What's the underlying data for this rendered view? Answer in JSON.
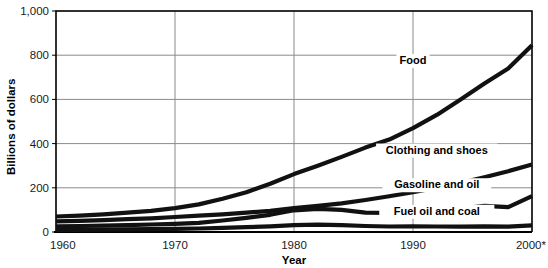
{
  "chart_data": {
    "type": "line",
    "title": "",
    "xlabel": "Year",
    "ylabel": "Billions of dollars",
    "xlim": [
      1960,
      2000
    ],
    "ylim": [
      0,
      1000
    ],
    "grid": true,
    "legend_position": "inline-labels",
    "x_ticks": [
      1960,
      1970,
      1980,
      1990,
      2000
    ],
    "x_tick_labels": [
      "1960",
      "1970",
      "1980",
      "1990",
      "2000*"
    ],
    "y_ticks": [
      0,
      200,
      400,
      600,
      800,
      1000
    ],
    "y_tick_labels": [
      "0",
      "200",
      "400",
      "600",
      "800",
      "1,000"
    ],
    "x": [
      1960,
      1962,
      1964,
      1966,
      1968,
      1970,
      1972,
      1974,
      1976,
      1978,
      1980,
      1982,
      1984,
      1986,
      1988,
      1990,
      1992,
      1994,
      1996,
      1998,
      2000
    ],
    "series": [
      {
        "name": "Food",
        "label": "Food",
        "label_x": 1990,
        "label_y": 760,
        "values": [
          70,
          74,
          80,
          88,
          96,
          108,
          122,
          146,
          172,
          205,
          245,
          285,
          320,
          355,
          395,
          405,
          455,
          510,
          560,
          610,
          648
        ]
      },
      {
        "name": "Clothing and shoes",
        "label": "Clothing and shoes",
        "label_x": 1992,
        "label_y": 355,
        "values": [
          25,
          27,
          30,
          34,
          38,
          43,
          49,
          55,
          62,
          72,
          82,
          90,
          100,
          112,
          124,
          136,
          150,
          168,
          188,
          212,
          240
        ]
      },
      {
        "name": "Gasoline and oil",
        "label": "Gasoline and oil",
        "label_x": 1992,
        "label_y": 198,
        "values": [
          14,
          15,
          16,
          18,
          20,
          23,
          26,
          34,
          42,
          50,
          78,
          88,
          85,
          70,
          68,
          78,
          80,
          85,
          95,
          92,
          130
        ]
      },
      {
        "name": "Fuel oil and coal",
        "label": "Fuel oil and coal",
        "label_x": 1992,
        "label_y": 78,
        "values": [
          5,
          5,
          6,
          6,
          7,
          8,
          9,
          12,
          14,
          17,
          22,
          24,
          23,
          19,
          17,
          18,
          17,
          16,
          18,
          16,
          20
        ]
      }
    ],
    "series_render": {
      "Food": {
        "values": [
          70,
          74,
          80,
          88,
          96,
          108,
          125,
          150,
          180,
          218,
          262,
          300,
          340,
          382,
          418,
          470,
          530,
          600,
          672,
          740,
          845
        ]
      },
      "Clothing and shoes": {
        "values": [
          48,
          50,
          54,
          58,
          62,
          68,
          74,
          80,
          88,
          96,
          108,
          118,
          130,
          145,
          162,
          180,
          200,
          222,
          248,
          275,
          305
        ]
      },
      "Gasoline and oil": {
        "values": [
          26,
          27,
          29,
          31,
          34,
          37,
          41,
          52,
          64,
          78,
          98,
          105,
          100,
          88,
          86,
          96,
          100,
          106,
          118,
          112,
          162
        ]
      },
      "Fuel oil and coal": {
        "values": [
          10,
          10,
          11,
          12,
          13,
          14,
          16,
          19,
          22,
          26,
          31,
          33,
          31,
          27,
          25,
          26,
          25,
          24,
          26,
          24,
          30
        ]
      }
    },
    "plot_geometry": {
      "left": 56,
      "right": 532,
      "top": 11,
      "bottom": 232
    }
  }
}
